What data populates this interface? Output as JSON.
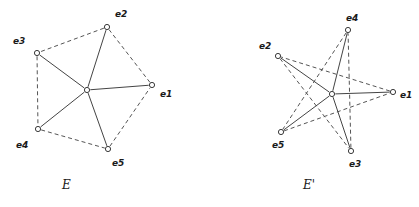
{
  "figure": {
    "background_color": "#ffffff",
    "ink_color": "#3a3a3a",
    "panels": [
      {
        "id": "panel-E",
        "caption": "E",
        "caption_position": {
          "x": 62,
          "y": 189
        },
        "center_node": {
          "name": "center",
          "x": 87,
          "y": 90
        },
        "nodes": [
          {
            "id": "e1",
            "label": "e1",
            "x": 152,
            "y": 85,
            "label_x": 160,
            "label_y": 97
          },
          {
            "id": "e2",
            "label": "e2",
            "x": 107,
            "y": 27,
            "label_x": 115,
            "label_y": 17
          },
          {
            "id": "e3",
            "label": "e3",
            "x": 37,
            "y": 53,
            "label_x": 13,
            "label_y": 44
          },
          {
            "id": "e4",
            "label": "e4",
            "x": 38,
            "y": 129,
            "label_x": 16,
            "label_y": 148
          },
          {
            "id": "e5",
            "label": "e5",
            "x": 108,
            "y": 149,
            "label_x": 112,
            "label_y": 166
          }
        ],
        "solid_edges": [
          [
            "center",
            "e1"
          ],
          [
            "center",
            "e2"
          ],
          [
            "center",
            "e3"
          ],
          [
            "center",
            "e4"
          ],
          [
            "center",
            "e5"
          ]
        ],
        "dashed_edges": [
          [
            "e1",
            "e2"
          ],
          [
            "e2",
            "e3"
          ],
          [
            "e3",
            "e4"
          ],
          [
            "e4",
            "e5"
          ],
          [
            "e5",
            "e1"
          ]
        ]
      },
      {
        "id": "panel-E-prime",
        "caption": "E'",
        "caption_position": {
          "x": 303,
          "y": 189
        },
        "center_node": {
          "name": "center",
          "x": 332,
          "y": 94
        },
        "nodes": [
          {
            "id": "e1",
            "label": "e1",
            "x": 393,
            "y": 92,
            "label_x": 400,
            "label_y": 98
          },
          {
            "id": "e2",
            "label": "e2",
            "x": 278,
            "y": 56,
            "label_x": 259,
            "label_y": 49
          },
          {
            "id": "e3",
            "label": "e3",
            "x": 351,
            "y": 151,
            "label_x": 349,
            "label_y": 167
          },
          {
            "id": "e4",
            "label": "e4",
            "x": 348,
            "y": 30,
            "label_x": 346,
            "label_y": 21
          },
          {
            "id": "e5",
            "label": "e5",
            "x": 281,
            "y": 132,
            "label_x": 272,
            "label_y": 148
          }
        ],
        "solid_edges": [
          [
            "center",
            "e1"
          ],
          [
            "center",
            "e2"
          ],
          [
            "center",
            "e3"
          ],
          [
            "center",
            "e4"
          ],
          [
            "center",
            "e5"
          ]
        ],
        "dashed_edges": [
          [
            "e1",
            "e2"
          ],
          [
            "e2",
            "e3"
          ],
          [
            "e3",
            "e4"
          ],
          [
            "e4",
            "e5"
          ],
          [
            "e5",
            "e1"
          ]
        ]
      }
    ]
  }
}
